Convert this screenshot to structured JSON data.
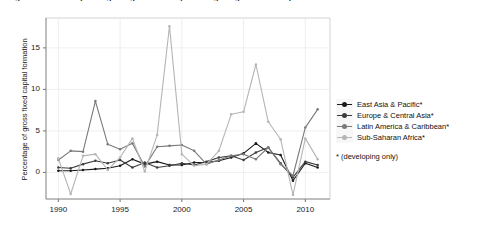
{
  "figure": {
    "caption": "Figure 1.1  Aid for spending on agriculture as percentage of gross fixed capital formation"
  },
  "chart_data": {
    "type": "line",
    "title": "",
    "xlabel": "",
    "ylabel": "Percentage of gross fixed capital formation",
    "xlim": [
      1989,
      2012
    ],
    "ylim": [
      -3.2,
      18.6
    ],
    "xticks": [
      1990,
      1995,
      2000,
      2005,
      2010
    ],
    "yticks": [
      0,
      5,
      10,
      15
    ],
    "grid": true,
    "legend_position": "right",
    "legend_note": "* (developing only)",
    "x": [
      1990,
      1991,
      1992,
      1993,
      1994,
      1995,
      1996,
      1997,
      1998,
      1999,
      2000,
      2001,
      2002,
      2003,
      2004,
      2005,
      2006,
      2007,
      2008,
      2009,
      2010,
      2011
    ],
    "series": [
      {
        "name": "East Asia & Pacific*",
        "color": "#1a1a1a",
        "values": [
          0.2,
          0.2,
          0.3,
          0.4,
          0.5,
          0.8,
          1.6,
          1.0,
          1.3,
          0.9,
          0.9,
          1.2,
          1.2,
          1.4,
          1.8,
          2.3,
          3.5,
          2.4,
          2.1,
          -1.0,
          1.1,
          0.6
        ]
      },
      {
        "name": "Europe & Central Asia*",
        "color": "#3d3d3d",
        "values": [
          0.6,
          0.5,
          1.0,
          1.4,
          1.1,
          1.5,
          0.6,
          1.2,
          0.6,
          0.8,
          1.1,
          0.9,
          1.3,
          1.8,
          2.0,
          1.5,
          2.4,
          3.0,
          1.1,
          -0.6,
          1.3,
          0.9
        ]
      },
      {
        "name": "Latin America & Caribbean*",
        "color": "#7a7a7a",
        "values": [
          1.5,
          2.6,
          2.5,
          8.6,
          3.4,
          2.8,
          3.5,
          0.7,
          3.1,
          3.2,
          3.3,
          2.6,
          1.0,
          1.5,
          2.0,
          2.2,
          1.6,
          3.0,
          1.0,
          -0.4,
          5.4,
          7.6
        ]
      },
      {
        "name": "Sub-Saharan Africa*",
        "color": "#b5b5b5",
        "values": [
          1.7,
          -2.6,
          2.0,
          2.2,
          0.3,
          1.8,
          4.1,
          0.1,
          4.5,
          17.6,
          2.2,
          0.8,
          1.0,
          2.6,
          7.0,
          7.3,
          13.0,
          6.1,
          4.0,
          -2.7,
          4.1,
          1.6
        ]
      }
    ]
  }
}
